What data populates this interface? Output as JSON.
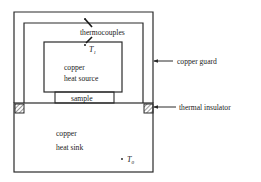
{
  "diagram": {
    "type": "thermal conductivity measurement apparatus (guarded hot plate)",
    "components": {
      "outer_frame": "copper guard",
      "heat_source": {
        "line1": "copper",
        "line2": "heat source"
      },
      "sample": "sample",
      "heat_sink": {
        "line1": "copper",
        "line2": "heat sink"
      },
      "insulators": "thermal insulator"
    },
    "labels": {
      "thermocouples": "thermocouples",
      "copper_guard": "copper guard",
      "thermal_insulator": "thermal insulator",
      "heat_source_line1": "copper",
      "heat_source_line2": "heat source",
      "sample": "sample",
      "heat_sink_line1": "copper",
      "heat_sink_line2": "heat sink",
      "t1_main": "T",
      "t1_sub": "1",
      "t0_main": "T",
      "t0_sub": "0"
    },
    "colors": {
      "line": "#2a2a2a",
      "background": "#ffffff"
    }
  }
}
